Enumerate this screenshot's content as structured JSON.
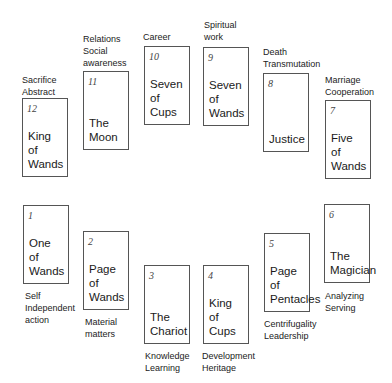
{
  "diagram": {
    "type": "tarot-house-spread",
    "cards": [
      {
        "house": "12",
        "name": "King\nof\nWands",
        "meaning": "Sacrifice\nAbstract",
        "pos": "top"
      },
      {
        "house": "11",
        "name": "The\nMoon",
        "meaning": "Relations\nSocial\nawareness",
        "pos": "top"
      },
      {
        "house": "10",
        "name": "Seven\nof\nCups",
        "meaning": "Career",
        "pos": "top"
      },
      {
        "house": "9",
        "name": "Seven\nof\nWands",
        "meaning": "Spiritual\nwork",
        "pos": "top"
      },
      {
        "house": "8",
        "name": "Justice",
        "meaning": "Death\nTransmutation",
        "pos": "top"
      },
      {
        "house": "7",
        "name": "Five\nof\nWands",
        "meaning": "Marriage\nCooperation",
        "pos": "top"
      },
      {
        "house": "1",
        "name": "One\nof\nWands",
        "meaning": "Self\nIndependent\naction",
        "pos": "bottom"
      },
      {
        "house": "2",
        "name": "Page\nof\nWands",
        "meaning": "Material\nmatters",
        "pos": "bottom"
      },
      {
        "house": "3",
        "name": "The\nChariot",
        "meaning": "Knowledge\nLearning",
        "pos": "bottom"
      },
      {
        "house": "4",
        "name": "King\nof\nCups",
        "meaning": "Development\nHeritage",
        "pos": "bottom"
      },
      {
        "house": "5",
        "name": "Page\nof\nPentacles",
        "meaning": "Centrifugality\nLeadership",
        "pos": "bottom"
      },
      {
        "house": "6",
        "name": "The\nMagician",
        "meaning": "Analyzing\nServing",
        "pos": "bottom"
      }
    ]
  }
}
